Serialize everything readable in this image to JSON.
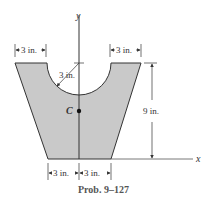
{
  "diagram": {
    "caption": "Prob. 9–127",
    "axes": {
      "x_label": "x",
      "y_label": "y"
    },
    "centroid_label": "C",
    "dimensions": {
      "top_left_width": "3 in.",
      "top_right_width": "3 in.",
      "radius": "3 in.",
      "height": "9 in.",
      "bottom_left_width": "3 in.",
      "bottom_right_width": "3 in."
    },
    "colors": {
      "fill": "#c9c9c9",
      "stroke": "#333333"
    }
  }
}
